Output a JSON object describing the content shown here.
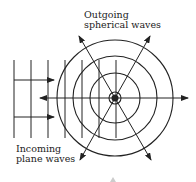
{
  "diagram": {
    "labels": {
      "outgoing_line1": "Outgoing",
      "outgoing_line2": "spherical waves",
      "incoming_line1": "Incoming",
      "incoming_line2": "plane waves"
    },
    "center": {
      "x": 115,
      "y": 98
    },
    "circle_radii": [
      6,
      25,
      42,
      58
    ],
    "plane_wave_lines_x": [
      14,
      31,
      48,
      65,
      82,
      99,
      116
    ],
    "plane_wave_span_y": [
      60,
      138
    ],
    "incoming_arrows_y": [
      80,
      117
    ],
    "colors": {
      "stroke": "#222222",
      "background": "#ffffff"
    }
  }
}
